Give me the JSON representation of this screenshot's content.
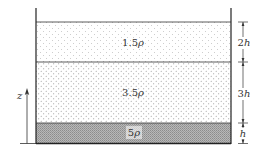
{
  "diagram": {
    "layers": [
      {
        "name": "top-layer",
        "density_label": "1.5ρ",
        "thickness_label": "2h"
      },
      {
        "name": "middle-layer",
        "density_label": "3.5ρ",
        "thickness_label": "3h"
      },
      {
        "name": "bottom-layer",
        "density_label": "5ρ",
        "thickness_label": "h"
      }
    ],
    "axis": {
      "label": "z"
    },
    "colors": {
      "line": "#222222",
      "dots": "#9a9a9a",
      "bottom_fill": "#a8a8a8"
    }
  }
}
